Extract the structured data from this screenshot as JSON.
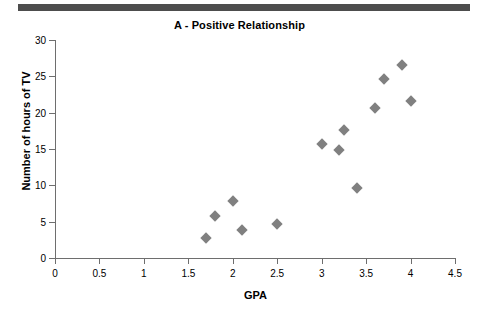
{
  "figure": {
    "top_rule": "divider-bar",
    "accent_color": "#4d4d4d",
    "marker_color": "#808080",
    "axis_color": "#6e6e6e"
  },
  "chart_data": {
    "type": "scatter",
    "title": "A - Positive Relationship",
    "xlabel": "GPA",
    "ylabel": "Number of hours of TV",
    "xlim": [
      0,
      4.5
    ],
    "ylim": [
      0,
      30
    ],
    "xticks": [
      "0",
      "0.5",
      "1",
      "1.5",
      "2",
      "2.5",
      "3",
      "3.5",
      "4",
      "4.5"
    ],
    "xtick_values": [
      0,
      0.5,
      1,
      1.5,
      2,
      2.5,
      3,
      3.5,
      4,
      4.5
    ],
    "yticks": [
      "0",
      "5",
      "10",
      "15",
      "20",
      "25",
      "30"
    ],
    "ytick_values": [
      0,
      5,
      10,
      15,
      20,
      25,
      30
    ],
    "grid": false,
    "legend": null,
    "marker": "diamond",
    "series": [
      {
        "name": "GPA vs hours of TV",
        "points": [
          {
            "x": 1.7,
            "y": 2.8
          },
          {
            "x": 1.8,
            "y": 5.8
          },
          {
            "x": 2.0,
            "y": 7.8
          },
          {
            "x": 2.1,
            "y": 3.8
          },
          {
            "x": 2.5,
            "y": 4.7
          },
          {
            "x": 3.0,
            "y": 15.7
          },
          {
            "x": 3.2,
            "y": 14.8
          },
          {
            "x": 3.25,
            "y": 17.6
          },
          {
            "x": 3.4,
            "y": 9.7
          },
          {
            "x": 3.6,
            "y": 20.7
          },
          {
            "x": 3.7,
            "y": 24.6
          },
          {
            "x": 3.9,
            "y": 26.6
          },
          {
            "x": 4.0,
            "y": 21.6
          }
        ]
      }
    ]
  }
}
